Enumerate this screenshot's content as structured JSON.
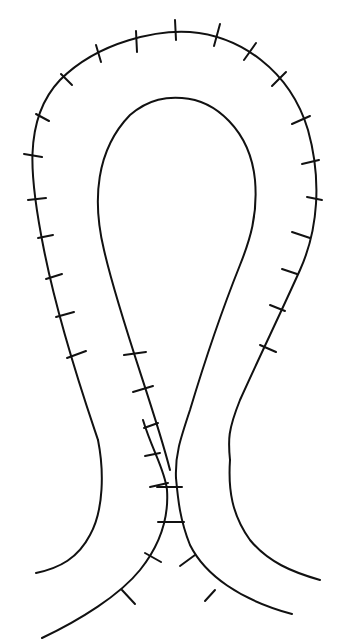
{
  "figure": {
    "stroke_color": "#111111",
    "background": "#ffffff",
    "top_cropped_text_fragment": "",
    "curves": [
      {
        "name": "outer-loop-incision",
        "d": "M 98 440 C 88 410 60 330 44 250 C 30 180 22 120 60 80 C 100 40 160 30 190 32 C 240 36 290 70 308 130 C 322 180 318 230 300 270 C 282 310 258 360 240 400 C 228 430 228 440 230 460"
      },
      {
        "name": "inner-loop-incision",
        "d": "M 170 470 C 155 410 120 320 104 250 C 92 200 96 150 130 115 C 150 98 168 97 182 98 C 215 100 250 130 255 180 C 258 215 250 240 240 265 C 222 310 205 360 190 410 C 180 440 175 455 176 478"
      },
      {
        "name": "lower-left-outer-curve",
        "d": "M 98 440 C 104 470 104 510 90 535 C 78 558 60 568 36 573"
      },
      {
        "name": "lower-right-outer-curve",
        "d": "M 230 460 C 228 490 232 515 250 540 C 268 562 292 572 320 580"
      },
      {
        "name": "left-crossing-limb",
        "d": "M 143 420 C 152 450 165 470 167 490 C 169 520 160 545 140 570 C 120 595 80 620 42 638"
      },
      {
        "name": "right-crossing-limb",
        "d": "M 176 478 C 178 500 180 520 190 545 C 205 575 240 600 292 614"
      }
    ],
    "ticks": [
      {
        "x1": 175,
        "y1": 20,
        "x2": 176,
        "y2": 40
      },
      {
        "x1": 220,
        "y1": 24,
        "x2": 214,
        "y2": 46
      },
      {
        "x1": 256,
        "y1": 43,
        "x2": 244,
        "y2": 60
      },
      {
        "x1": 286,
        "y1": 72,
        "x2": 272,
        "y2": 86
      },
      {
        "x1": 310,
        "y1": 116,
        "x2": 292,
        "y2": 124
      },
      {
        "x1": 319,
        "y1": 160,
        "x2": 302,
        "y2": 164
      },
      {
        "x1": 322,
        "y1": 200,
        "x2": 307,
        "y2": 197
      },
      {
        "x1": 310,
        "y1": 238,
        "x2": 292,
        "y2": 232
      },
      {
        "x1": 297,
        "y1": 274,
        "x2": 282,
        "y2": 269
      },
      {
        "x1": 285,
        "y1": 311,
        "x2": 270,
        "y2": 305
      },
      {
        "x1": 276,
        "y1": 352,
        "x2": 260,
        "y2": 345
      },
      {
        "x1": 136,
        "y1": 31,
        "x2": 137,
        "y2": 52
      },
      {
        "x1": 96,
        "y1": 45,
        "x2": 101,
        "y2": 62
      },
      {
        "x1": 61,
        "y1": 74,
        "x2": 72,
        "y2": 85
      },
      {
        "x1": 36,
        "y1": 114,
        "x2": 49,
        "y2": 121
      },
      {
        "x1": 24,
        "y1": 154,
        "x2": 42,
        "y2": 157
      },
      {
        "x1": 28,
        "y1": 200,
        "x2": 46,
        "y2": 198
      },
      {
        "x1": 38,
        "y1": 238,
        "x2": 53,
        "y2": 235
      },
      {
        "x1": 46,
        "y1": 279,
        "x2": 62,
        "y2": 274
      },
      {
        "x1": 56,
        "y1": 317,
        "x2": 74,
        "y2": 312
      },
      {
        "x1": 67,
        "y1": 358,
        "x2": 86,
        "y2": 351
      },
      {
        "x1": 124,
        "y1": 355,
        "x2": 146,
        "y2": 352
      },
      {
        "x1": 133,
        "y1": 392,
        "x2": 153,
        "y2": 386
      },
      {
        "x1": 144,
        "y1": 428,
        "x2": 158,
        "y2": 423
      },
      {
        "x1": 145,
        "y1": 456,
        "x2": 160,
        "y2": 453
      },
      {
        "x1": 150,
        "y1": 487,
        "x2": 168,
        "y2": 483
      },
      {
        "x1": 157,
        "y1": 487,
        "x2": 182,
        "y2": 487
      },
      {
        "x1": 158,
        "y1": 522,
        "x2": 184,
        "y2": 522
      },
      {
        "x1": 145,
        "y1": 553,
        "x2": 161,
        "y2": 562
      },
      {
        "x1": 180,
        "y1": 566,
        "x2": 195,
        "y2": 555
      },
      {
        "x1": 122,
        "y1": 590,
        "x2": 135,
        "y2": 604
      },
      {
        "x1": 205,
        "y1": 601,
        "x2": 215,
        "y2": 590
      }
    ]
  }
}
